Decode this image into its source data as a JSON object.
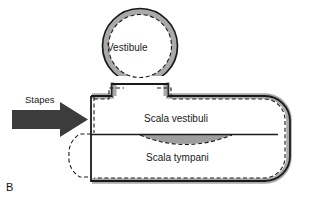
{
  "figure": {
    "panel_label": "B",
    "labels": {
      "vestibule": "Vestibule",
      "scala_vestibuli": "Scala vestibuli",
      "scala_tympani": "Scala tympani",
      "stapes": "Stapes"
    },
    "colors": {
      "outline": "#1a1a1a",
      "wall_gray": "#a9a9a9",
      "membrane_gray": "#9e9e9e",
      "arrow_gray": "#3c3c3c",
      "background": "#ffffff",
      "text": "#1a1a1a"
    },
    "elements": [
      {
        "name": "vestibule",
        "shape": "circle",
        "cx": 140,
        "cy": 46,
        "r": 38
      },
      {
        "name": "vestibule-neck",
        "shape": "connector"
      },
      {
        "name": "cochlear-duct",
        "shape": "rounded-tube"
      },
      {
        "name": "basilar-membrane",
        "shape": "line-with-bulge"
      },
      {
        "name": "round-window",
        "shape": "dashed-bulge"
      },
      {
        "name": "stapes-arrow",
        "shape": "block-arrow",
        "direction": "right"
      },
      {
        "name": "helicotrema",
        "shape": "open-gap"
      }
    ]
  }
}
